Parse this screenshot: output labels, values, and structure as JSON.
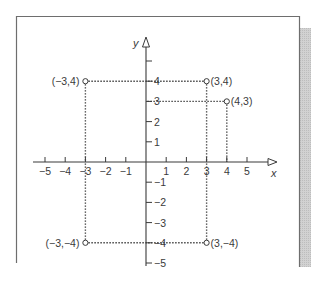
{
  "chart_data": {
    "type": "scatter",
    "title": "",
    "xlabel": "x",
    "ylabel": "y",
    "xlim": [
      -5,
      5
    ],
    "ylim": [
      -5,
      5
    ],
    "grid": false,
    "x_ticks": [
      -5,
      -4,
      -3,
      -2,
      -1,
      1,
      2,
      3,
      4,
      5
    ],
    "x_tick_labels": [
      "−5",
      "−4",
      "−3",
      "−2",
      "−1",
      "1",
      "2",
      "3",
      "4",
      "5"
    ],
    "y_ticks": [
      5,
      4,
      3,
      2,
      1,
      -1,
      -2,
      -3,
      -4,
      -5
    ],
    "y_tick_labels": [
      "",
      "4",
      "3",
      "2",
      "1",
      "−1",
      "−2",
      "−3",
      "−4",
      "−5"
    ],
    "points": [
      {
        "x": -3,
        "y": 4,
        "label": "(−3,4)",
        "label_side": "left"
      },
      {
        "x": 3,
        "y": 4,
        "label": "(3,4)",
        "label_side": "right"
      },
      {
        "x": 4,
        "y": 3,
        "label": "(4,3)",
        "label_side": "right"
      },
      {
        "x": -3,
        "y": -4,
        "label": "(−3,−4)",
        "label_side": "left"
      },
      {
        "x": 3,
        "y": -4,
        "label": "(3,−4)",
        "label_side": "right"
      }
    ],
    "marker": "hollow-circle",
    "guide_lines": "dotted projections from each point to both axes"
  },
  "style": {
    "ink": "#3a3a3a",
    "frame": "#6e6e6e",
    "shadow": "#c8c8c8"
  }
}
